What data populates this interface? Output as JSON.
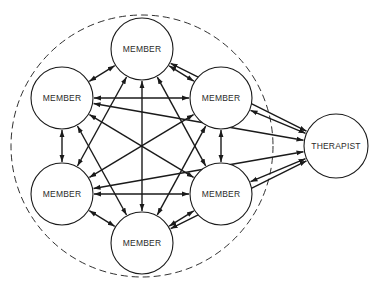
{
  "colors": {
    "stroke": "#1a1a1a",
    "node_fill": "#ffffff",
    "background": "#ffffff"
  },
  "group_boundary": {
    "cx": 142,
    "cy": 146,
    "r": 131,
    "style": "dashed"
  },
  "nodes": [
    {
      "id": "m_top",
      "label": "MEMBER",
      "cx": 142,
      "cy": 49,
      "r": 31
    },
    {
      "id": "m_ul",
      "label": "MEMBER",
      "cx": 62,
      "cy": 98,
      "r": 31
    },
    {
      "id": "m_ur",
      "label": "MEMBER",
      "cx": 221,
      "cy": 98,
      "r": 31
    },
    {
      "id": "m_ll",
      "label": "MEMBER",
      "cx": 62,
      "cy": 194,
      "r": 31
    },
    {
      "id": "m_lr",
      "label": "MEMBER",
      "cx": 221,
      "cy": 194,
      "r": 31
    },
    {
      "id": "m_bot",
      "label": "MEMBER",
      "cx": 142,
      "cy": 243,
      "r": 31
    },
    {
      "id": "therapist",
      "label": "THERAPIST",
      "cx": 336,
      "cy": 146,
      "r": 32
    }
  ],
  "edges": [
    {
      "from": "m_top",
      "to": "m_ul"
    },
    {
      "from": "m_top",
      "to": "m_ur"
    },
    {
      "from": "m_top",
      "to": "m_ll"
    },
    {
      "from": "m_top",
      "to": "m_lr"
    },
    {
      "from": "m_top",
      "to": "m_bot"
    },
    {
      "from": "m_top",
      "to": "therapist"
    },
    {
      "from": "m_ul",
      "to": "m_ur"
    },
    {
      "from": "m_ul",
      "to": "m_ll"
    },
    {
      "from": "m_ul",
      "to": "m_lr"
    },
    {
      "from": "m_ul",
      "to": "m_bot"
    },
    {
      "from": "m_ul",
      "to": "therapist"
    },
    {
      "from": "m_ur",
      "to": "m_ll"
    },
    {
      "from": "m_ur",
      "to": "m_lr"
    },
    {
      "from": "m_ur",
      "to": "m_bot"
    },
    {
      "from": "m_ur",
      "to": "therapist"
    },
    {
      "from": "m_ll",
      "to": "m_lr"
    },
    {
      "from": "m_ll",
      "to": "m_bot"
    },
    {
      "from": "m_ll",
      "to": "therapist"
    },
    {
      "from": "m_lr",
      "to": "m_bot"
    },
    {
      "from": "m_lr",
      "to": "therapist"
    },
    {
      "from": "m_bot",
      "to": "therapist"
    }
  ]
}
